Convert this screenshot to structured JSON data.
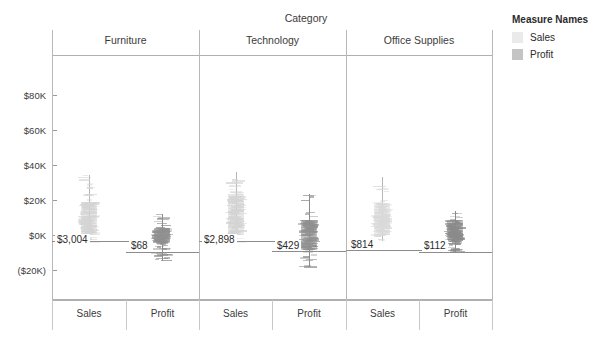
{
  "chart_data": {
    "type": "box",
    "title": "",
    "xlabel": "Category",
    "ylabel": "",
    "ylim": [
      -20000,
      90000
    ],
    "grid": false,
    "legend_position": "right",
    "axis": {
      "column_field_label": "Category",
      "y_ticks": [
        {
          "label": "$80K",
          "value": 80000
        },
        {
          "label": "$60K",
          "value": 60000
        },
        {
          "label": "$40K",
          "value": 40000
        },
        {
          "label": "$20K",
          "value": 20000
        },
        {
          "label": "$0K",
          "value": 0
        },
        {
          "label": "($20K)",
          "value": -20000
        }
      ]
    },
    "panels": [
      {
        "name": "Furniture",
        "measures": [
          {
            "name": "Sales",
            "label": "$3,004",
            "average": 3004,
            "median": 3100,
            "q1": 300,
            "q3": 19000,
            "whisker_low": -5200,
            "whisker_high": 34500,
            "color": "#d4d4d4"
          },
          {
            "name": "Profit",
            "label": "$68",
            "average": 68,
            "median": 200,
            "q1": -4200,
            "q3": 4200,
            "whisker_low": -14800,
            "whisker_high": 12200,
            "color": "#8f8f8f"
          }
        ]
      },
      {
        "name": "Technology",
        "measures": [
          {
            "name": "Sales",
            "label": "$2,898",
            "average": 2898,
            "median": 3000,
            "q1": 200,
            "q3": 23500,
            "whisker_low": -4800,
            "whisker_high": 36000,
            "color": "#d4d4d4"
          },
          {
            "name": "Profit",
            "label": "$429",
            "average": 429,
            "median": 400,
            "q1": -8500,
            "q3": 8800,
            "whisker_low": -18500,
            "whisker_high": 23500,
            "color": "#8f8f8f"
          }
        ]
      },
      {
        "name": "Office Supplies",
        "measures": [
          {
            "name": "Sales",
            "label": "$814",
            "average": 814,
            "median": 900,
            "q1": 100,
            "q3": 18500,
            "whisker_low": -3200,
            "whisker_high": 33000,
            "color": "#d9d9d9"
          },
          {
            "name": "Profit",
            "label": "$112",
            "average": 112,
            "median": 150,
            "q1": -3600,
            "q3": 8600,
            "whisker_low": -9800,
            "whisker_high": 13500,
            "color": "#8a8a8a"
          }
        ]
      }
    ],
    "x_tick_labels": [
      "Sales",
      "Profit",
      "Sales",
      "Profit",
      "Sales",
      "Profit"
    ]
  },
  "legend": {
    "title": "Measure Names",
    "items": [
      {
        "label": "Sales",
        "color": "#eaeaea"
      },
      {
        "label": "Profit",
        "color": "#c4c4c4"
      }
    ]
  }
}
